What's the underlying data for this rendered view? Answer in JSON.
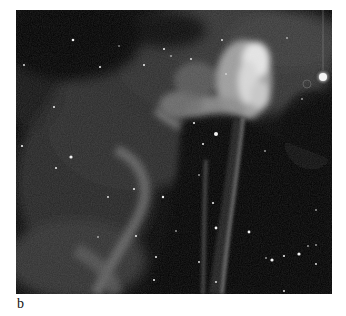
{
  "figure": {
    "panel_label": "b",
    "colors": {
      "background": "#ffffff",
      "sky": "#050505",
      "nebula_bright": "#e8e8e8",
      "nebula_faint": "#4a4a4a"
    },
    "stars": [
      {
        "x": 57,
        "y": 30,
        "r": 1.3
      },
      {
        "x": 8,
        "y": 55,
        "r": 0.9
      },
      {
        "x": 128,
        "y": 55,
        "r": 1.0
      },
      {
        "x": 210,
        "y": 64,
        "r": 0.8
      },
      {
        "x": 103,
        "y": 36,
        "r": 0.7
      },
      {
        "x": 84,
        "y": 57,
        "r": 1.0
      },
      {
        "x": 148,
        "y": 39,
        "r": 1.0
      },
      {
        "x": 155,
        "y": 46,
        "r": 0.8
      },
      {
        "x": 175,
        "y": 49,
        "r": 0.9
      },
      {
        "x": 206,
        "y": 30,
        "r": 0.9
      },
      {
        "x": 271,
        "y": 28,
        "r": 0.8
      },
      {
        "x": 307,
        "y": 67,
        "r": 4.0
      },
      {
        "x": 200,
        "y": 124,
        "r": 2.0
      },
      {
        "x": 178,
        "y": 113,
        "r": 1.0
      },
      {
        "x": 187,
        "y": 134,
        "r": 1.0
      },
      {
        "x": 249,
        "y": 141,
        "r": 0.8
      },
      {
        "x": 286,
        "y": 89,
        "r": 0.8
      },
      {
        "x": 38,
        "y": 97,
        "r": 1.0
      },
      {
        "x": 6,
        "y": 136,
        "r": 1.1
      },
      {
        "x": 55,
        "y": 147,
        "r": 1.6
      },
      {
        "x": 40,
        "y": 158,
        "r": 1.0
      },
      {
        "x": 118,
        "y": 179,
        "r": 1.0
      },
      {
        "x": 147,
        "y": 187,
        "r": 1.2
      },
      {
        "x": 183,
        "y": 165,
        "r": 0.8
      },
      {
        "x": 197,
        "y": 193,
        "r": 1.0
      },
      {
        "x": 200,
        "y": 218,
        "r": 1.4
      },
      {
        "x": 233,
        "y": 222,
        "r": 1.4
      },
      {
        "x": 256,
        "y": 250,
        "r": 1.6
      },
      {
        "x": 268,
        "y": 246,
        "r": 1.0
      },
      {
        "x": 140,
        "y": 247,
        "r": 1.0
      },
      {
        "x": 120,
        "y": 226,
        "r": 1.0
      },
      {
        "x": 138,
        "y": 270,
        "r": 1.0
      },
      {
        "x": 292,
        "y": 236,
        "r": 0.8
      },
      {
        "x": 300,
        "y": 235,
        "r": 0.8
      },
      {
        "x": 283,
        "y": 244,
        "r": 1.6
      },
      {
        "x": 300,
        "y": 254,
        "r": 0.9
      },
      {
        "x": 183,
        "y": 252,
        "r": 0.9
      },
      {
        "x": 160,
        "y": 221,
        "r": 0.8
      },
      {
        "x": 82,
        "y": 227,
        "r": 0.8
      },
      {
        "x": 92,
        "y": 187,
        "r": 0.9
      },
      {
        "x": 200,
        "y": 272,
        "r": 0.9
      },
      {
        "x": 250,
        "y": 248,
        "r": 0.8
      },
      {
        "x": 268,
        "y": 281,
        "r": 0.9
      },
      {
        "x": 300,
        "y": 200,
        "r": 0.8
      }
    ]
  }
}
